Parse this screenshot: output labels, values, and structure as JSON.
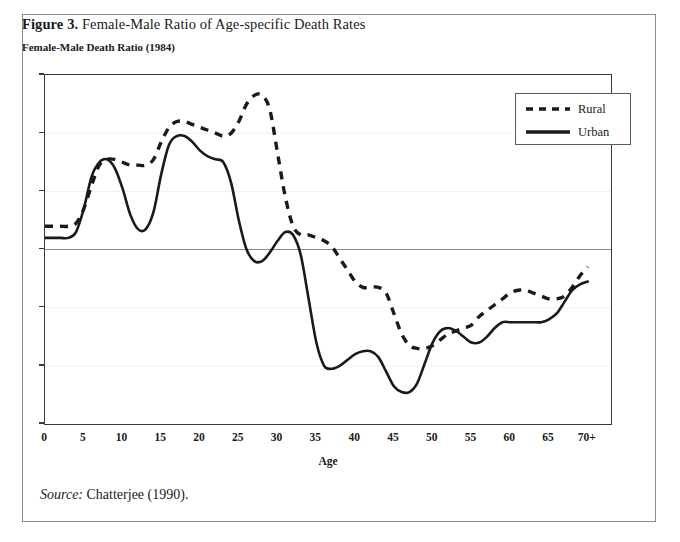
{
  "figure": {
    "number_label": "Figure 3.",
    "title": "Female-Male Ratio of Age-specific Death Rates",
    "axis_heading": "Female-Male Death Ratio (1984)",
    "source_word": "Source:",
    "source_text": "Chatterjee (1990).",
    "border_color": "#8d8d8d"
  },
  "legend": {
    "position": "top-right",
    "entries": [
      {
        "label": "Rural",
        "style": "dashed",
        "color": "#1a1a1a"
      },
      {
        "label": "Urban",
        "style": "solid",
        "color": "#1a1a1a"
      }
    ]
  },
  "chart_data": {
    "type": "line",
    "title": "Female-Male Ratio of Age-specific Death Rates",
    "subtitle": "Female-Male Death Ratio (1984)",
    "xlabel": "Age",
    "ylabel": "Female-Male Death Ratio (1984)",
    "xlim": [
      0,
      73
    ],
    "ylim": [
      0.4,
      1.6
    ],
    "ytick_labels": [
      "1.6",
      "1.4",
      "1.2",
      "1",
      "0.8",
      "0.6",
      "0.4"
    ],
    "ytick_values": [
      1.6,
      1.4,
      1.2,
      1.0,
      0.8,
      0.6,
      0.4
    ],
    "xtick_labels": [
      "0",
      "5",
      "10",
      "15",
      "20",
      "25",
      "30",
      "35",
      "40",
      "45",
      "50",
      "55",
      "60",
      "65",
      "70+"
    ],
    "xtick_values": [
      0,
      5,
      10,
      15,
      20,
      25,
      30,
      35,
      40,
      45,
      50,
      55,
      60,
      65,
      70
    ],
    "grid": "horizontal-faint",
    "reference_line": {
      "value": 1.0,
      "color": "#8a8a8a"
    },
    "series": [
      {
        "name": "Rural",
        "style": "dashed",
        "x": [
          0,
          1,
          2,
          3,
          4,
          5,
          6,
          7,
          8,
          9,
          10,
          11,
          12,
          13,
          14,
          15,
          16,
          17,
          18,
          19,
          20,
          21,
          22,
          23,
          24,
          25,
          26,
          27,
          28,
          29,
          30,
          31,
          32,
          33,
          34,
          35,
          36,
          37,
          38,
          39,
          40,
          41,
          42,
          43,
          44,
          45,
          46,
          47,
          48,
          49,
          50,
          51,
          52,
          53,
          54,
          55,
          56,
          57,
          58,
          59,
          60,
          61,
          62,
          63,
          64,
          65,
          66,
          67,
          68,
          69,
          70
        ],
        "values": [
          1.08,
          1.08,
          1.08,
          1.08,
          1.09,
          1.14,
          1.22,
          1.29,
          1.31,
          1.31,
          1.3,
          1.29,
          1.29,
          1.29,
          1.31,
          1.37,
          1.42,
          1.44,
          1.44,
          1.43,
          1.42,
          1.41,
          1.4,
          1.39,
          1.4,
          1.44,
          1.5,
          1.53,
          1.53,
          1.48,
          1.33,
          1.18,
          1.08,
          1.05,
          1.05,
          1.04,
          1.03,
          1.01,
          0.97,
          0.93,
          0.89,
          0.87,
          0.87,
          0.87,
          0.85,
          0.78,
          0.71,
          0.67,
          0.66,
          0.66,
          0.67,
          0.69,
          0.71,
          0.72,
          0.73,
          0.74,
          0.77,
          0.79,
          0.81,
          0.83,
          0.85,
          0.86,
          0.86,
          0.85,
          0.84,
          0.83,
          0.83,
          0.84,
          0.87,
          0.91,
          0.94
        ]
      },
      {
        "name": "Urban",
        "style": "solid",
        "x": [
          0,
          1,
          2,
          3,
          4,
          5,
          6,
          7,
          8,
          9,
          10,
          11,
          12,
          13,
          14,
          15,
          16,
          17,
          18,
          19,
          20,
          21,
          22,
          23,
          24,
          25,
          26,
          27,
          28,
          29,
          30,
          31,
          32,
          33,
          34,
          35,
          36,
          37,
          38,
          39,
          40,
          41,
          42,
          43,
          44,
          45,
          46,
          47,
          48,
          49,
          50,
          51,
          52,
          53,
          54,
          55,
          56,
          57,
          58,
          59,
          60,
          61,
          62,
          63,
          64,
          65,
          66,
          67,
          68,
          69,
          70
        ],
        "values": [
          1.04,
          1.04,
          1.04,
          1.04,
          1.06,
          1.14,
          1.25,
          1.3,
          1.31,
          1.28,
          1.21,
          1.12,
          1.07,
          1.07,
          1.13,
          1.26,
          1.36,
          1.39,
          1.39,
          1.37,
          1.34,
          1.32,
          1.31,
          1.3,
          1.23,
          1.1,
          1.0,
          0.96,
          0.96,
          0.99,
          1.03,
          1.06,
          1.05,
          0.98,
          0.83,
          0.68,
          0.6,
          0.59,
          0.6,
          0.62,
          0.64,
          0.65,
          0.65,
          0.63,
          0.58,
          0.53,
          0.51,
          0.51,
          0.54,
          0.61,
          0.68,
          0.72,
          0.73,
          0.72,
          0.7,
          0.68,
          0.68,
          0.7,
          0.73,
          0.75,
          0.75,
          0.75,
          0.75,
          0.75,
          0.75,
          0.76,
          0.78,
          0.82,
          0.86,
          0.88,
          0.89
        ]
      }
    ]
  }
}
